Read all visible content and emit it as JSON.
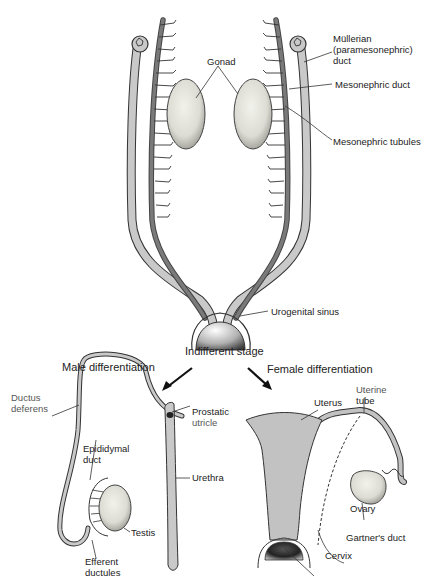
{
  "diagram": {
    "indifferent_stage": {
      "title": "Indifferent stage",
      "labels": {
        "mullerian_duct": [
          "Müllerian",
          "(paramesonephric)",
          "duct"
        ],
        "mesonephric_duct": "Mesonephric duct",
        "mesonephric_tubules": "Mesonephric tubules",
        "gonad": "Gonad",
        "urogenital_sinus": "Urogenital sinus"
      }
    },
    "male": {
      "title": "Male differentiation",
      "labels": {
        "ductus_deferens": [
          "Ductus",
          "deferens"
        ],
        "prostatic_utricle": [
          "Prostatic",
          "utricle"
        ],
        "epididymal_duct": [
          "Epididymal",
          "duct"
        ],
        "urethra": "Urethra",
        "testis": "Testis",
        "efferent_ductules": [
          "Efferent",
          "ductules"
        ]
      }
    },
    "female": {
      "title": "Female differentiation",
      "labels": {
        "uterine_tube": [
          "Uterine",
          "tube"
        ],
        "uterus": "Uterus",
        "ovary": "Ovary",
        "gartners_duct": "Gartner's duct",
        "cervix": "Cervix"
      }
    },
    "colors": {
      "mullerian_fill": "#c9c9c9",
      "mesonephric_fill": "#7a7a7a",
      "gonad_fill": "#e4e4dc",
      "uterus_fill": "#c2c2c2",
      "outline": "#333333",
      "label_text": "#222222"
    }
  }
}
